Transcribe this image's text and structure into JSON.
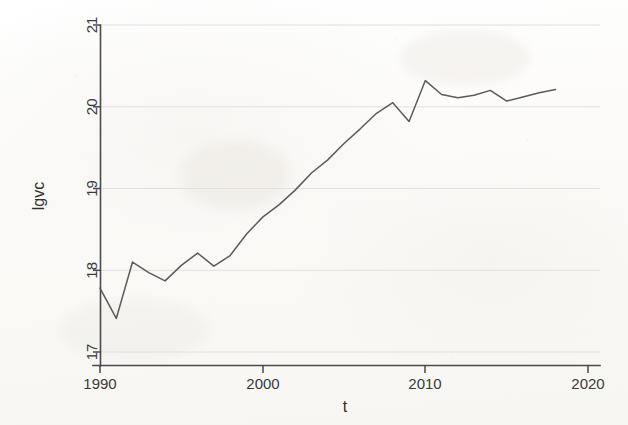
{
  "figure": {
    "background_color": "#fdfdfc",
    "line_color": "#5b5b5b",
    "axis_color": "#4a4a4a",
    "grid_color": "#e2e0dc"
  },
  "chart_data": {
    "type": "line",
    "title": "",
    "xlabel": "t",
    "ylabel": "lgvc",
    "xlim": [
      1989.3,
      1990.0
    ],
    "ylim": [
      16.82,
      21.05
    ],
    "xticks": [
      1990,
      2000,
      2010,
      2020
    ],
    "xtick_labels": [
      "1990",
      "2000",
      "2010",
      "2020"
    ],
    "yticks": [
      17,
      18,
      19,
      20,
      21
    ],
    "ytick_labels": [
      "17",
      "18",
      "19",
      "20",
      "21"
    ],
    "grid": "horizontal",
    "legend": "none",
    "series": [
      {
        "name": "lgvc",
        "x": [
          1990,
          1991,
          1992,
          1993,
          1994,
          1995,
          1996,
          1997,
          1998,
          1999,
          2000,
          2001,
          2002,
          2003,
          2004,
          2005,
          2006,
          2007,
          2008,
          2009,
          2010,
          2011,
          2012,
          2013,
          2014,
          2015,
          2016,
          2017,
          2018
        ],
        "values": [
          17.78,
          17.41,
          18.1,
          17.97,
          17.87,
          18.06,
          18.21,
          18.05,
          18.18,
          18.44,
          18.65,
          18.8,
          18.98,
          19.19,
          19.35,
          19.55,
          19.73,
          19.92,
          20.05,
          19.82,
          20.32,
          20.15,
          20.11,
          20.14,
          20.2,
          20.07,
          20.12,
          20.17,
          20.21
        ]
      }
    ]
  },
  "y_axis": {
    "label": "lgvc",
    "ticks": [
      "21",
      "20",
      "19",
      "18",
      "17"
    ]
  },
  "x_axis": {
    "label": "t",
    "ticks": [
      "1990",
      "2000",
      "2010",
      "2020"
    ]
  }
}
